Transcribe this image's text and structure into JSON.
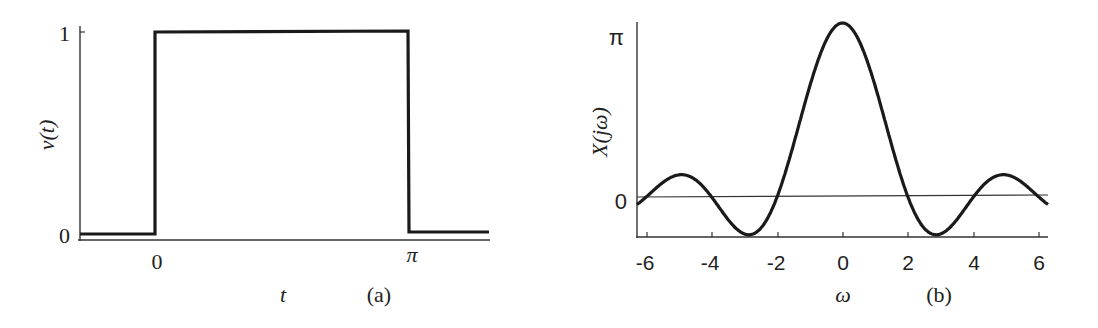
{
  "chart_data": [
    {
      "type": "line",
      "panel_label": "(a)",
      "title": "",
      "xlabel": "t",
      "ylabel": "v(t)",
      "x_ticks": [
        "0",
        "π"
      ],
      "y_ticks": [
        "0",
        "1"
      ],
      "xlim": [
        -1.0,
        3.9
      ],
      "ylim": [
        0,
        1
      ],
      "grid": false,
      "legend": null,
      "series": [
        {
          "name": "v(t)",
          "description": "rectangular pulse: 1 for 0 <= t <= pi, 0 otherwise",
          "x": [
            -1.0,
            0,
            0,
            3.1416,
            3.1416,
            3.9
          ],
          "y": [
            0,
            0,
            1,
            1,
            0,
            0
          ]
        }
      ]
    },
    {
      "type": "line",
      "panel_label": "(b)",
      "title": "",
      "xlabel": "ω",
      "ylabel": "X(jω)",
      "x_ticks": [
        "-6",
        "-4",
        "-2",
        "0",
        "2",
        "4",
        "6"
      ],
      "y_ticks": [
        "0",
        "π"
      ],
      "xlim": [
        -6.28,
        6.28
      ],
      "ylim": [
        -0.68,
        3.1416
      ],
      "grid": false,
      "legend": null,
      "series": [
        {
          "name": "X(jω)",
          "description": "2·sin(πω/2)/ω ; peak π at ω=0, zeros at ±2, ±4, ±6",
          "x": [
            -6.28,
            -5.0,
            -4.0,
            -2.86,
            -2.0,
            -1.0,
            0,
            1.0,
            2.0,
            2.86,
            4.0,
            5.0,
            6.28
          ],
          "y": [
            -0.3,
            0.4,
            0.0,
            -0.68,
            0.0,
            2.0,
            3.1416,
            2.0,
            0.0,
            -0.68,
            0.0,
            0.4,
            -0.3
          ]
        }
      ]
    }
  ],
  "labels": {
    "a": {
      "ylabel": "v(t)",
      "xlabel": "t",
      "panel": "(a)",
      "xtick0": "0",
      "xtickpi": "π",
      "ytick0": "0",
      "ytick1": "1"
    },
    "b": {
      "ylabel": "X(jω)",
      "xlabel": "ω",
      "panel": "(b)",
      "ytick0": "0",
      "ytickpi": "π",
      "xticks": [
        "-6",
        "-4",
        "-2",
        "0",
        "2",
        "4",
        "6"
      ]
    }
  }
}
